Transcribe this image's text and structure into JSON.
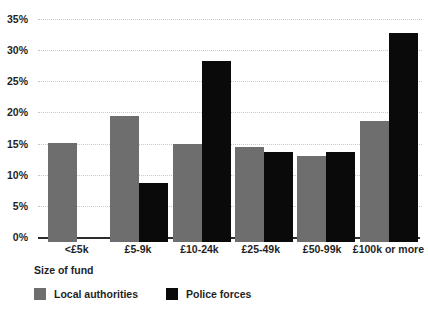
{
  "chart_data": {
    "type": "bar",
    "title": "",
    "subtitle": "",
    "xlabel": "Size of fund",
    "ylabel": "",
    "categories": [
      "<£5k",
      "£5-9k",
      "£10-24k",
      "£25-49k",
      "£50-99k",
      "£100k or more"
    ],
    "series": [
      {
        "name": "Local authorities",
        "color": "#6e6e6e",
        "values": [
          15.6,
          19.8,
          15.4,
          14.9,
          13.5,
          19.0
        ]
      },
      {
        "name": "Police forces",
        "color": "#0a0a0a",
        "values": [
          null,
          9.3,
          28.4,
          14.2,
          14.1,
          32.8
        ]
      }
    ],
    "ylim": [
      0,
      35
    ],
    "ytick_values": [
      0,
      5,
      10,
      15,
      20,
      25,
      30,
      35
    ],
    "ytick_labels": [
      "0%",
      "5%",
      "10%",
      "15%",
      "20%",
      "25%",
      "30%",
      "35%"
    ],
    "grid": true,
    "grid_style": "dotted",
    "legend_position": "bottom-left",
    "legend": [
      "Local authorities",
      "Police forces"
    ]
  },
  "colors": {
    "local_authorities": "#6e6e6e",
    "police_forces": "#0a0a0a",
    "gridline": "#c9c9c9",
    "axis": "#2b2b2b",
    "background": "#ffffff",
    "text": "#1f1f1f"
  }
}
